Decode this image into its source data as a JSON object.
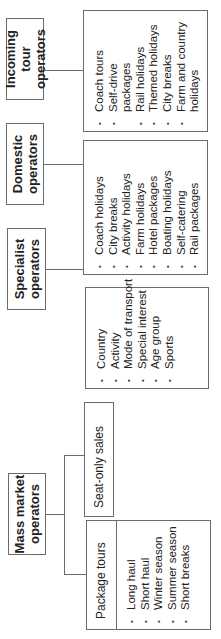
{
  "diagram": {
    "groups": [
      {
        "title": "Incoming tour operators",
        "items": [
          "Coach tours",
          "Self-drive packages",
          "Rail holidays",
          "Themed holidays",
          "City breaks",
          "Farm and country holidays"
        ]
      },
      {
        "title": "Domestic operators",
        "items": [
          "Coach holidays",
          "City breaks",
          "Activity holidays",
          "Farm holidays",
          "Hotel packages",
          "Boating holidays",
          "Self-catering",
          "Rail packages"
        ]
      },
      {
        "title": "Specialist operators",
        "items": [
          "Country",
          "Activity",
          "Mode of transport",
          "Special interest",
          "Age group",
          "Sports"
        ]
      },
      {
        "title": "Mass market operators",
        "children": [
          {
            "title": "Seat-only sales"
          },
          {
            "title": "Package tours",
            "items": [
              "Long haul",
              "Short haul",
              "Winter season",
              "Summer season",
              "Short breaks"
            ]
          }
        ]
      }
    ]
  }
}
